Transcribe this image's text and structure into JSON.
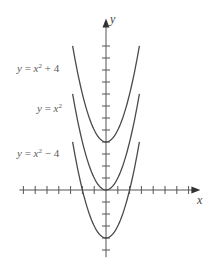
{
  "chart_data": {
    "type": "line",
    "title": "",
    "xlabel": "x",
    "ylabel": "y",
    "xlim": [
      -7,
      8
    ],
    "ylim": [
      -5.6,
      14.3
    ],
    "x_ticks": [
      -7,
      -6,
      -5,
      -4,
      -3,
      -2,
      -1,
      1,
      2,
      3,
      4,
      5,
      6,
      7
    ],
    "y_ticks": [
      -5,
      -4,
      -3,
      -2,
      -1,
      1,
      2,
      3,
      4,
      5,
      6,
      7,
      8,
      9,
      10,
      11,
      12
    ],
    "grid": false,
    "legend": "inline labels to the left of curves",
    "series": [
      {
        "name": "y = x² + 4",
        "formula": "x^2 + 4",
        "x_range": [
          -2.83,
          2.83
        ],
        "vertex": [
          0,
          4
        ],
        "label_parts": [
          "y",
          " = ",
          "x",
          "2",
          " + 4"
        ]
      },
      {
        "name": "y = x²",
        "formula": "x^2",
        "x_range": [
          -2.83,
          2.83
        ],
        "vertex": [
          0,
          0
        ],
        "label_parts": [
          "y",
          " = ",
          "x",
          "2",
          ""
        ]
      },
      {
        "name": "y = x² − 4",
        "formula": "x^2 - 4",
        "x_range": [
          -2.83,
          2.83
        ],
        "vertex": [
          0,
          -4
        ],
        "label_parts": [
          "y",
          " = ",
          "x",
          "2",
          " − 4"
        ]
      }
    ],
    "colors": {
      "curve": "#4a4a4a",
      "axis": "#555555",
      "label": "#5a5a5a"
    }
  }
}
